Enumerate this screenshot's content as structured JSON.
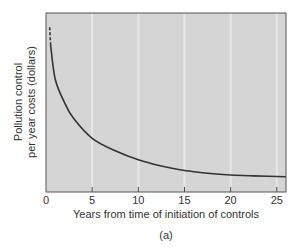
{
  "chart_data": {
    "type": "line",
    "title": "",
    "caption": "(a)",
    "xlabel": "Years from time of initiation of controls",
    "ylabel_lines": [
      "Pollution control",
      "per year costs (dollars)"
    ],
    "ylabel": "Pollution control per year costs (dollars)",
    "xlim": [
      0,
      26
    ],
    "ylim": null,
    "x_ticks": [
      0,
      5,
      10,
      15,
      20,
      25
    ],
    "x_tick_labels": [
      "0",
      "5",
      "10",
      "15",
      "20",
      "25"
    ],
    "y_ticks": [],
    "grid": {
      "vertical": true,
      "horizontal": false
    },
    "legend": null,
    "series": [
      {
        "name": "Pollution control per year costs",
        "style": "solid (dashed near x≈0.4)",
        "color": "#333333",
        "x": [
          0.4,
          0.5,
          1,
          2,
          3,
          5,
          7.5,
          10,
          12.5,
          15,
          17.5,
          20,
          22.5,
          26
        ],
        "y_relative": [
          0.92,
          0.82,
          0.63,
          0.5,
          0.41,
          0.3,
          0.23,
          0.18,
          0.145,
          0.12,
          0.105,
          0.095,
          0.09,
          0.085
        ]
      }
    ],
    "annotations": [
      "Initial segment of curve is dashed"
    ]
  },
  "colors": {
    "plot_bg": "#d5d5d5",
    "gridline": "#e6e6e6",
    "border": "#555555",
    "curve": "#333333",
    "text": "#333333"
  }
}
